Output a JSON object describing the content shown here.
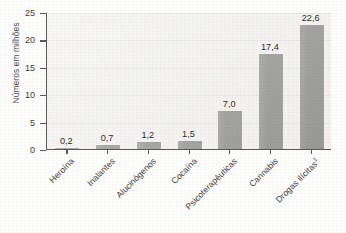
{
  "chart_data": {
    "type": "bar",
    "title": "",
    "subtitle": "",
    "xlabel": "",
    "ylabel": "Números em milhões",
    "ylim": [
      0,
      25
    ],
    "ytick_labels": [
      "0",
      "5",
      "10",
      "15",
      "20",
      "25"
    ],
    "ytick_values": [
      0,
      5,
      10,
      15,
      20,
      25
    ],
    "grid": true,
    "legend": false,
    "categories": [
      "Heroína",
      "Inalantes",
      "Alucinógenos",
      "Cocaína",
      "Psicoterapêuticas",
      "Cannabis",
      "Drogas ilícitas"
    ],
    "values": [
      0.2,
      0.7,
      1.2,
      1.5,
      7.0,
      17.4,
      22.6
    ],
    "value_labels": [
      "0,2",
      "0,7",
      "1,2",
      "1,5",
      "7,0",
      "17,4",
      "22,6"
    ],
    "footnote_marker": "1",
    "footnote_category_index": 6,
    "bar_color": "#6e6e6e",
    "plot_background": "#f3f2f0",
    "axis_color": "#5a5a5a"
  }
}
